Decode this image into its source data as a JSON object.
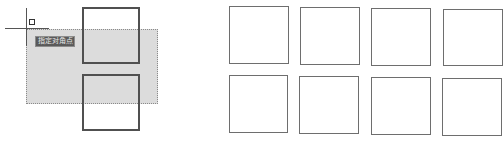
{
  "canvas": {
    "background": "#ffffff",
    "selection_fill": "#dcdcdc",
    "selection_border": "#8a8a8a"
  },
  "left_panel": {
    "tooltip": {
      "text": "指定对角点"
    },
    "crosshair": {
      "icon": "crosshair-cursor-icon"
    },
    "pickbox": {
      "icon": "pickbox-icon"
    },
    "selection_window": "crossing-selection-window",
    "squares": [
      {
        "x": 82,
        "y": 7,
        "w": 58,
        "h": 57
      },
      {
        "x": 82,
        "y": 74,
        "w": 58,
        "h": 57
      }
    ]
  },
  "right_panel": {
    "squares": [
      {
        "x": 229,
        "y": 6,
        "w": 60,
        "h": 58
      },
      {
        "x": 300,
        "y": 7,
        "w": 60,
        "h": 58
      },
      {
        "x": 371,
        "y": 8,
        "w": 60,
        "h": 58
      },
      {
        "x": 443,
        "y": 9,
        "w": 60,
        "h": 57
      },
      {
        "x": 229,
        "y": 75,
        "w": 59,
        "h": 58
      },
      {
        "x": 299,
        "y": 76,
        "w": 60,
        "h": 58
      },
      {
        "x": 371,
        "y": 77,
        "w": 60,
        "h": 58
      },
      {
        "x": 442,
        "y": 78,
        "w": 60,
        "h": 58
      }
    ]
  }
}
